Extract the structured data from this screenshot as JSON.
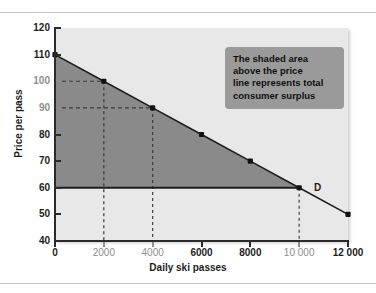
{
  "chart_data": {
    "type": "line",
    "title": "",
    "xlabel": "Daily ski passes",
    "ylabel": "Price per pass",
    "xlim": [
      0,
      12000
    ],
    "ylim": [
      40,
      120
    ],
    "grid": false,
    "legend": null,
    "series": [
      {
        "name": "D",
        "label": "D",
        "x": [
          0,
          2000,
          4000,
          6000,
          8000,
          10000,
          12000
        ],
        "values": [
          110,
          100,
          90,
          80,
          70,
          60,
          50
        ]
      },
      {
        "name": "price-line",
        "label": "Price = 60",
        "x": [
          0,
          10000
        ],
        "values": [
          60,
          60
        ]
      }
    ],
    "x_ticks": [
      {
        "value": 0,
        "label": "0",
        "muted": false
      },
      {
        "value": 2000,
        "label": "2000",
        "muted": true
      },
      {
        "value": 4000,
        "label": "4000",
        "muted": true
      },
      {
        "value": 6000,
        "label": "6000",
        "muted": false
      },
      {
        "value": 8000,
        "label": "8000",
        "muted": false
      },
      {
        "value": 10000,
        "label": "10 000",
        "muted": true
      },
      {
        "value": 12000,
        "label": "12 000",
        "muted": false
      }
    ],
    "y_ticks": [
      {
        "value": 120,
        "label": "120",
        "muted": false
      },
      {
        "value": 110,
        "label": "110",
        "muted": false
      },
      {
        "value": 100,
        "label": "100",
        "muted": true
      },
      {
        "value": 90,
        "label": "90",
        "muted": true
      },
      {
        "value": 80,
        "label": "80",
        "muted": false
      },
      {
        "value": 70,
        "label": "70",
        "muted": false
      },
      {
        "value": 60,
        "label": "60",
        "muted": false
      },
      {
        "value": 50,
        "label": "50",
        "muted": false
      },
      {
        "value": 40,
        "label": "40",
        "muted": false
      }
    ],
    "guide_lines": [
      {
        "x": 2000,
        "y": 100
      },
      {
        "x": 4000,
        "y": 90
      },
      {
        "x": 10000,
        "y": 60,
        "direction": "down"
      }
    ],
    "shaded_region": {
      "name": "consumer surplus",
      "vertices": [
        [
          0,
          110
        ],
        [
          10000,
          60
        ],
        [
          0,
          60
        ]
      ],
      "color": "#8a8a8a"
    },
    "annotation": {
      "text": "The shaded area above the price line represents total consumer surplus",
      "lines": [
        "The shaded area",
        "above the price",
        "line represents total",
        "consumer surplus"
      ]
    },
    "curve_label": "D",
    "colors": {
      "plot_background": "#e8e8e8",
      "shaded_area": "#8a8a8a",
      "line": "#1d1d1d",
      "axis": "#2b2b2b",
      "annotation_background": "#9a9a9a",
      "muted_text": "#8e8e8e"
    }
  }
}
